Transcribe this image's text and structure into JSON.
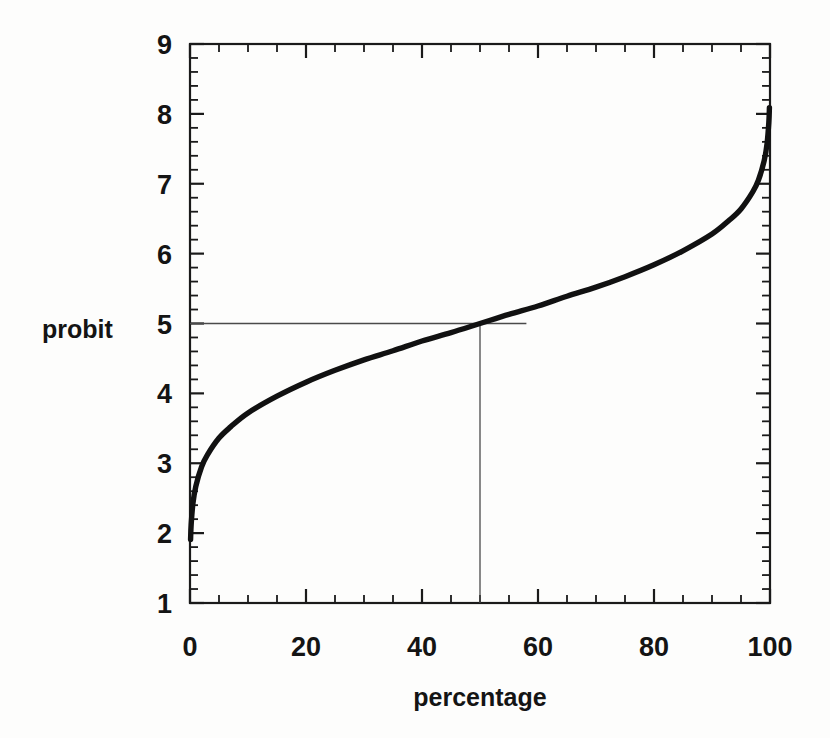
{
  "figure": {
    "background_color": "#fdfdfc",
    "ink_color": "#141414",
    "curve_color": "#111111",
    "reference_line_color": "#4a4a4a"
  },
  "labels": {
    "y_axis_title": "probit",
    "x_axis_title": "percentage"
  },
  "chart_data": {
    "type": "line",
    "title": "",
    "xlabel": "percentage",
    "ylabel": "probit",
    "xlim": [
      0,
      100
    ],
    "ylim": [
      1,
      9
    ],
    "grid": false,
    "legend": false,
    "x_ticks": [
      0,
      20,
      40,
      60,
      80,
      100
    ],
    "x_tick_labels": [
      "0",
      "20",
      "40",
      "60",
      "80",
      "100"
    ],
    "x_minor_tick_step": 5,
    "y_ticks": [
      1,
      2,
      3,
      4,
      5,
      6,
      7,
      8,
      9
    ],
    "y_tick_labels": [
      "1",
      "2",
      "3",
      "4",
      "5",
      "6",
      "7",
      "8",
      "9"
    ],
    "y_minor_tick_step": 0.2,
    "relation": "probit = 5 + inverse_normal_cdf(percentage / 100)",
    "series": [
      {
        "name": "probit curve",
        "x": [
          0.1,
          0.2,
          0.5,
          1,
          2,
          3,
          5,
          7,
          10,
          15,
          20,
          25,
          30,
          35,
          40,
          45,
          50,
          55,
          60,
          65,
          70,
          75,
          80,
          85,
          90,
          93,
          95,
          97,
          98,
          99,
          99.5,
          99.8,
          99.9
        ],
        "values": [
          1.91,
          2.12,
          2.42,
          2.67,
          2.95,
          3.12,
          3.36,
          3.52,
          3.72,
          3.96,
          4.16,
          4.33,
          4.48,
          4.61,
          4.75,
          4.87,
          5.0,
          5.13,
          5.25,
          5.39,
          5.52,
          5.67,
          5.84,
          6.04,
          6.28,
          6.48,
          6.64,
          6.88,
          7.05,
          7.33,
          7.58,
          7.88,
          8.09
        ]
      }
    ],
    "annotations": [
      {
        "name": "horizontal-reference-line",
        "description": "horizontal line at probit 5 from left axis to just past the curve",
        "y": 5,
        "x_start": 0,
        "x_end": 58
      },
      {
        "name": "vertical-reference-line",
        "description": "vertical line at percentage 50 from probit 5 down to the bottom axis",
        "x": 50,
        "y_start": 5,
        "y_end": 1
      }
    ],
    "intersection_point": {
      "x": 50,
      "y": 5
    }
  }
}
